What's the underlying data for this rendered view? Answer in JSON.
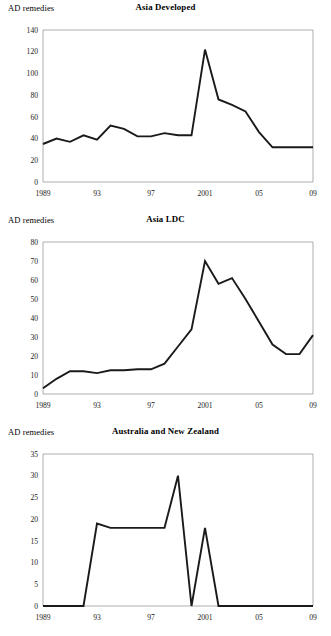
{
  "figure": {
    "background": "#ffffff",
    "line_color": "#1a1a1a",
    "axis_color": "#9a9a9a"
  },
  "panels": [
    {
      "id": "asia-developed",
      "ylabel": "AD remedies",
      "title": "Asia Developed"
    },
    {
      "id": "asia-ldc",
      "ylabel": "AD remedies",
      "title": "Asia LDC"
    },
    {
      "id": "australia-new-zealand",
      "ylabel": "AD remedies",
      "title": "Australia and New Zealand"
    }
  ],
  "chart_data": [
    {
      "type": "line",
      "title": "Asia Developed",
      "xlabel": "",
      "ylabel": "AD remedies",
      "x": [
        1989,
        1990,
        1991,
        1992,
        1993,
        1994,
        1995,
        1996,
        1997,
        1998,
        1999,
        2000,
        2001,
        2002,
        2003,
        2004,
        2005,
        2006,
        2007,
        2008,
        2009
      ],
      "values": [
        35,
        40,
        37,
        43,
        39,
        52,
        49,
        42,
        42,
        45,
        43,
        43,
        122,
        76,
        71,
        65,
        46,
        32,
        32,
        32,
        32
      ],
      "xlim": [
        1989,
        2009
      ],
      "ylim": [
        0,
        140
      ],
      "yticks": [
        0,
        20,
        40,
        60,
        80,
        100,
        120,
        140
      ],
      "xticks": [
        1989,
        1993,
        1997,
        2001,
        2005,
        2009
      ],
      "xticklabels": [
        "1989",
        "93",
        "97",
        "2001",
        "05",
        "09"
      ],
      "grid": false,
      "legend": "none"
    },
    {
      "type": "line",
      "title": "Asia LDC",
      "xlabel": "",
      "ylabel": "AD remedies",
      "x": [
        1989,
        1990,
        1991,
        1992,
        1993,
        1994,
        1995,
        1996,
        1997,
        1998,
        1999,
        2000,
        2001,
        2002,
        2003,
        2004,
        2005,
        2006,
        2007,
        2008,
        2009
      ],
      "values": [
        3,
        8,
        12,
        12,
        11,
        12.5,
        12.5,
        13,
        13,
        16,
        25,
        34,
        70,
        58,
        61,
        50,
        38,
        26,
        21,
        21,
        31
      ],
      "xlim": [
        1989,
        2009
      ],
      "ylim": [
        0,
        80
      ],
      "yticks": [
        0,
        10,
        20,
        30,
        40,
        50,
        60,
        70,
        80
      ],
      "xticks": [
        1989,
        1993,
        1997,
        2001,
        2005,
        2009
      ],
      "xticklabels": [
        "1989",
        "93",
        "97",
        "2001",
        "05",
        "09"
      ],
      "grid": false,
      "legend": "none"
    },
    {
      "type": "line",
      "title": "Australia and New Zealand",
      "xlabel": "",
      "ylabel": "AD remedies",
      "x": [
        1989,
        1990,
        1991,
        1992,
        1993,
        1994,
        1995,
        1996,
        1997,
        1998,
        1999,
        2000,
        2001,
        2002,
        2003,
        2004,
        2005,
        2006,
        2007,
        2008,
        2009
      ],
      "values": [
        0,
        0,
        0,
        0,
        19,
        18,
        18,
        18,
        18,
        18,
        30,
        0,
        18,
        0,
        0,
        0,
        0,
        0,
        0,
        0,
        0
      ],
      "xlim": [
        1989,
        2009
      ],
      "ylim": [
        0,
        35
      ],
      "yticks": [
        0,
        5,
        10,
        15,
        20,
        25,
        30,
        35
      ],
      "xticks": [
        1989,
        1993,
        1997,
        2001,
        2005,
        2009
      ],
      "xticklabels": [
        "1989",
        "93",
        "97",
        "2001",
        "05",
        "09"
      ],
      "grid": false,
      "legend": "none"
    }
  ]
}
